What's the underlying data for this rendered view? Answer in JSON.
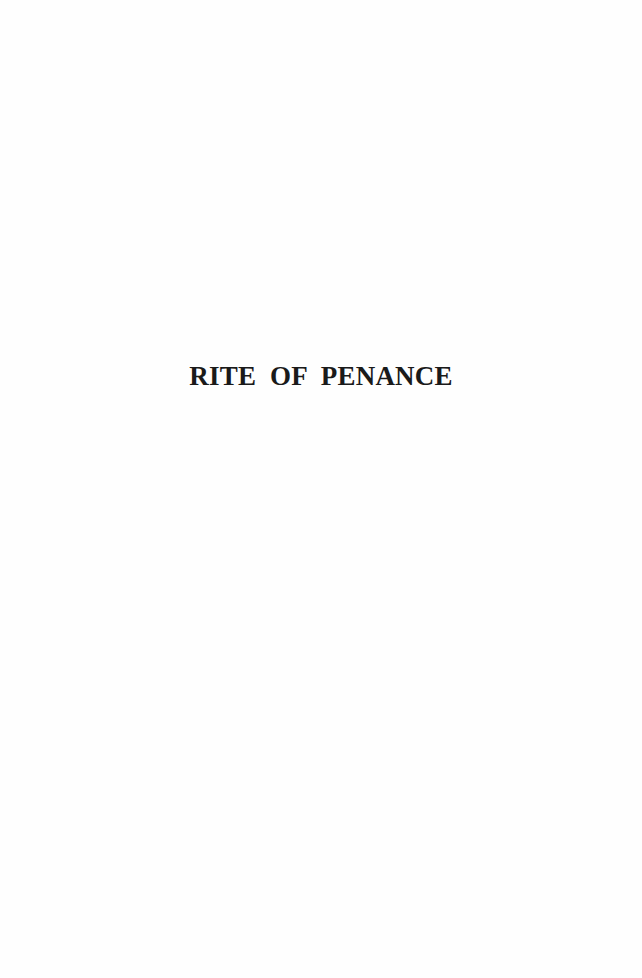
{
  "page": {
    "title": "RITE  OF  PENANCE",
    "background_color": "#fefefe",
    "text_color": "#1a1a1a"
  }
}
